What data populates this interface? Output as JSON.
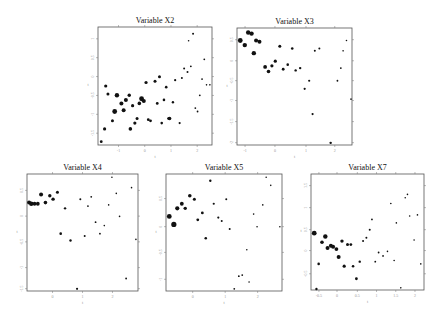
{
  "chart_data": [
    {
      "type": "scatter",
      "title": "Variable X2",
      "xlabel": "t",
      "ylabel": "t",
      "frame": {
        "x": 98,
        "y": 27,
        "w": 114,
        "h": 118
      },
      "xticks": [
        {
          "label": "-1",
          "f": 0.18
        },
        {
          "label": "0",
          "f": 0.41
        },
        {
          "label": "1",
          "f": 0.64
        },
        {
          "label": "2",
          "f": 0.87
        }
      ],
      "yticks": [
        {
          "label": "1",
          "f": 0.1
        },
        {
          "label": "0.5",
          "f": 0.26
        },
        {
          "label": "0",
          "f": 0.42
        },
        {
          "label": "-0.5",
          "f": 0.58
        },
        {
          "label": "-1",
          "f": 0.74
        },
        {
          "label": "-1.5",
          "f": 0.9
        }
      ],
      "points": [
        [
          0.02,
          0.98,
          1.4
        ],
        [
          0.05,
          0.87,
          1.6
        ],
        [
          0.06,
          0.5,
          1.6
        ],
        [
          0.08,
          0.57,
          1.5
        ],
        [
          0.12,
          0.8,
          1.5
        ],
        [
          0.14,
          0.72,
          2.4
        ],
        [
          0.16,
          0.58,
          2.2
        ],
        [
          0.2,
          0.65,
          2.0
        ],
        [
          0.22,
          0.71,
          2.0
        ],
        [
          0.24,
          0.62,
          2.0
        ],
        [
          0.27,
          0.58,
          1.7
        ],
        [
          0.3,
          0.67,
          1.6
        ],
        [
          0.28,
          0.87,
          1.8
        ],
        [
          0.32,
          0.82,
          1.6
        ],
        [
          0.34,
          0.78,
          1.5
        ],
        [
          0.36,
          0.65,
          1.8
        ],
        [
          0.38,
          0.61,
          2.4
        ],
        [
          0.4,
          0.63,
          2.0
        ],
        [
          0.42,
          0.47,
          1.6
        ],
        [
          0.44,
          0.79,
          1.4
        ],
        [
          0.46,
          0.8,
          1.4
        ],
        [
          0.5,
          0.46,
          1.5
        ],
        [
          0.52,
          0.65,
          1.4
        ],
        [
          0.54,
          0.42,
          1.5
        ],
        [
          0.56,
          0.82,
          1.3
        ],
        [
          0.58,
          0.62,
          1.3
        ],
        [
          0.6,
          0.51,
          1.3
        ],
        [
          0.62,
          0.78,
          1.3
        ],
        [
          0.63,
          0.78,
          1.8
        ],
        [
          0.66,
          0.64,
          1.2
        ],
        [
          0.68,
          0.45,
          1.1
        ],
        [
          0.72,
          0.82,
          1.1
        ],
        [
          0.74,
          0.43,
          1.0
        ],
        [
          0.76,
          0.35,
          1.0
        ],
        [
          0.79,
          0.38,
          1.0
        ],
        [
          0.82,
          0.33,
          0.9
        ],
        [
          0.84,
          0.05,
          1.0
        ],
        [
          0.86,
          0.69,
          0.9
        ],
        [
          0.88,
          0.72,
          0.9
        ],
        [
          0.9,
          0.58,
          0.9
        ],
        [
          0.92,
          0.44,
          0.9
        ],
        [
          0.94,
          0.27,
          0.9
        ],
        [
          0.96,
          0.49,
          0.8
        ],
        [
          0.99,
          0.49,
          0.8
        ],
        [
          0.8,
          0.11,
          0.8
        ]
      ]
    },
    {
      "type": "scatter",
      "title": "Variable X3",
      "xlabel": "t",
      "ylabel": "t",
      "frame": {
        "x": 237,
        "y": 28,
        "w": 115,
        "h": 117
      },
      "xticks": [
        {
          "label": "-1",
          "f": 0.07
        },
        {
          "label": "0",
          "f": 0.33
        },
        {
          "label": "1",
          "f": 0.6
        },
        {
          "label": "2",
          "f": 0.85
        }
      ],
      "yticks": [
        {
          "label": "0.5",
          "f": 0.1
        },
        {
          "label": "0",
          "f": 0.28
        },
        {
          "label": "-0.5",
          "f": 0.45
        },
        {
          "label": "-1",
          "f": 0.62
        },
        {
          "label": "-1.5",
          "f": 0.8
        },
        {
          "label": "-2",
          "f": 0.98
        }
      ],
      "points": [
        [
          0.02,
          0.1,
          2.4
        ],
        [
          0.06,
          0.14,
          2.2
        ],
        [
          0.09,
          0.03,
          2.2
        ],
        [
          0.12,
          0.04,
          2.2
        ],
        [
          0.16,
          0.1,
          2.0
        ],
        [
          0.19,
          0.11,
          2.0
        ],
        [
          0.14,
          0.21,
          2.2
        ],
        [
          0.24,
          0.33,
          1.9
        ],
        [
          0.27,
          0.37,
          1.8
        ],
        [
          0.3,
          0.32,
          1.6
        ],
        [
          0.33,
          0.28,
          1.6
        ],
        [
          0.37,
          0.15,
          1.5
        ],
        [
          0.4,
          0.35,
          1.4
        ],
        [
          0.44,
          0.31,
          1.3
        ],
        [
          0.48,
          0.17,
          1.3
        ],
        [
          0.51,
          0.36,
          1.2
        ],
        [
          0.55,
          0.34,
          1.2
        ],
        [
          0.59,
          0.52,
          1.1
        ],
        [
          0.63,
          0.45,
          1.1
        ],
        [
          0.66,
          0.74,
          1.1
        ],
        [
          0.68,
          0.19,
          1.0
        ],
        [
          0.72,
          0.17,
          1.0
        ],
        [
          0.82,
          0.99,
          1.2
        ],
        [
          0.88,
          0.45,
          0.9
        ],
        [
          0.91,
          0.34,
          0.9
        ],
        [
          0.96,
          0.1,
          0.8
        ],
        [
          1.0,
          0.61,
          0.8
        ],
        [
          0.93,
          0.19,
          0.8
        ]
      ]
    },
    {
      "type": "scatter",
      "title": "Variable X4",
      "xlabel": "t",
      "ylabel": "t",
      "frame": {
        "x": 27,
        "y": 174,
        "w": 111,
        "h": 117
      },
      "xticks": [
        {
          "label": "0",
          "f": 0.23
        },
        {
          "label": "1",
          "f": 0.5
        },
        {
          "label": "2",
          "f": 0.77
        }
      ],
      "yticks": [
        {
          "label": "0.5",
          "f": 0.14
        },
        {
          "label": "0",
          "f": 0.36
        },
        {
          "label": "-0.5",
          "f": 0.58
        },
        {
          "label": "-1",
          "f": 0.8
        },
        {
          "label": "-1.5",
          "f": 0.98
        }
      ],
      "points": [
        [
          0.01,
          0.24,
          2.0
        ],
        [
          0.03,
          0.25,
          2.2
        ],
        [
          0.06,
          0.25,
          1.9
        ],
        [
          0.09,
          0.25,
          1.9
        ],
        [
          0.12,
          0.17,
          2.0
        ],
        [
          0.16,
          0.24,
          1.8
        ],
        [
          0.2,
          0.18,
          1.7
        ],
        [
          0.23,
          0.21,
          1.7
        ],
        [
          0.27,
          0.15,
          1.5
        ],
        [
          0.3,
          0.51,
          1.3
        ],
        [
          0.34,
          0.29,
          1.2
        ],
        [
          0.39,
          0.57,
          1.2
        ],
        [
          0.45,
          0.99,
          1.1
        ],
        [
          0.48,
          0.21,
          1.0
        ],
        [
          0.52,
          0.53,
          1.0
        ],
        [
          0.55,
          0.27,
          0.9
        ],
        [
          0.58,
          0.19,
          0.9
        ],
        [
          0.62,
          0.41,
          0.9
        ],
        [
          0.66,
          0.51,
          0.9
        ],
        [
          0.7,
          0.44,
          0.8
        ],
        [
          0.74,
          0.26,
          0.8
        ],
        [
          0.77,
          0.02,
          0.8
        ],
        [
          0.81,
          0.16,
          0.8
        ],
        [
          0.84,
          0.36,
          0.8
        ],
        [
          0.9,
          0.9,
          0.9
        ],
        [
          0.95,
          0.11,
          0.8
        ],
        [
          0.99,
          0.56,
          0.8
        ]
      ]
    },
    {
      "type": "scatter",
      "title": "Variable X5",
      "xlabel": "t",
      "ylabel": "t",
      "frame": {
        "x": 166,
        "y": 174,
        "w": 116,
        "h": 117
      },
      "xticks": [
        {
          "label": "0",
          "f": 0.23
        },
        {
          "label": "1",
          "f": 0.51
        },
        {
          "label": "2",
          "f": 0.79
        }
      ],
      "yticks": [
        {
          "label": "0.5",
          "f": 0.21
        },
        {
          "label": "0",
          "f": 0.45
        },
        {
          "label": "-0.5",
          "f": 0.67
        },
        {
          "label": "-1",
          "f": 0.9
        }
      ],
      "points": [
        [
          0.02,
          0.36,
          2.4
        ],
        [
          0.06,
          0.43,
          2.6
        ],
        [
          0.09,
          0.29,
          2.1
        ],
        [
          0.13,
          0.25,
          1.9
        ],
        [
          0.16,
          0.29,
          1.7
        ],
        [
          0.2,
          0.18,
          1.8
        ],
        [
          0.24,
          0.21,
          1.5
        ],
        [
          0.27,
          0.39,
          1.4
        ],
        [
          0.31,
          0.33,
          1.4
        ],
        [
          0.34,
          0.55,
          1.3
        ],
        [
          0.38,
          0.05,
          1.2
        ],
        [
          0.41,
          0.25,
          1.1
        ],
        [
          0.45,
          0.37,
          1.1
        ],
        [
          0.48,
          0.4,
          1.0
        ],
        [
          0.52,
          0.21,
          1.0
        ],
        [
          0.55,
          0.47,
          1.0
        ],
        [
          0.59,
          0.99,
          0.9
        ],
        [
          0.63,
          0.88,
          0.9
        ],
        [
          0.66,
          0.87,
          0.9
        ],
        [
          0.7,
          0.65,
          0.8
        ],
        [
          0.72,
          0.93,
          0.8
        ],
        [
          0.76,
          0.34,
          0.8
        ],
        [
          0.79,
          0.45,
          0.8
        ],
        [
          0.84,
          0.26,
          0.8
        ],
        [
          0.87,
          0.02,
          0.8
        ],
        [
          0.91,
          0.09,
          0.8
        ],
        [
          0.99,
          0.45,
          0.8
        ]
      ]
    },
    {
      "type": "scatter",
      "title": "Variable X7",
      "xlabel": "t",
      "ylabel": "t",
      "frame": {
        "x": 311,
        "y": 174,
        "w": 113,
        "h": 116
      },
      "xticks": [
        {
          "label": "-0.5",
          "f": 0.07
        },
        {
          "label": "0",
          "f": 0.23
        },
        {
          "label": "0.5",
          "f": 0.41
        },
        {
          "label": "1",
          "f": 0.58
        },
        {
          "label": "1.5",
          "f": 0.75
        },
        {
          "label": "2",
          "f": 0.92
        }
      ],
      "yticks": [
        {
          "label": "1.5",
          "f": 0.1
        },
        {
          "label": "1",
          "f": 0.29
        },
        {
          "label": "0.5",
          "f": 0.48
        },
        {
          "label": "0",
          "f": 0.66
        },
        {
          "label": "-0.5",
          "f": 0.86
        }
      ],
      "points": [
        [
          0.02,
          0.51,
          2.4
        ],
        [
          0.06,
          0.78,
          1.3
        ],
        [
          0.09,
          0.59,
          1.8
        ],
        [
          0.12,
          0.54,
          2.2
        ],
        [
          0.14,
          0.64,
          2.0
        ],
        [
          0.17,
          0.62,
          2.0
        ],
        [
          0.19,
          0.63,
          2.0
        ],
        [
          0.22,
          0.65,
          1.9
        ],
        [
          0.24,
          0.72,
          2.0
        ],
        [
          0.27,
          0.58,
          1.7
        ],
        [
          0.29,
          0.8,
          1.6
        ],
        [
          0.32,
          0.61,
          1.5
        ],
        [
          0.35,
          0.61,
          1.4
        ],
        [
          0.37,
          0.8,
          1.3
        ],
        [
          0.4,
          0.91,
          1.4
        ],
        [
          0.43,
          0.76,
          1.2
        ],
        [
          0.46,
          0.58,
          1.0
        ],
        [
          0.49,
          0.55,
          1.0
        ],
        [
          0.52,
          0.48,
          1.0
        ],
        [
          0.54,
          0.39,
          0.9
        ],
        [
          0.57,
          0.76,
          0.9
        ],
        [
          0.6,
          0.68,
          0.9
        ],
        [
          0.64,
          0.71,
          0.9
        ],
        [
          0.68,
          0.67,
          0.8
        ],
        [
          0.71,
          0.25,
          0.8
        ],
        [
          0.74,
          0.75,
          0.8
        ],
        [
          0.76,
          0.42,
          0.8
        ],
        [
          0.8,
          0.99,
          0.8
        ],
        [
          0.84,
          0.2,
          0.8
        ],
        [
          0.86,
          0.17,
          0.8
        ],
        [
          0.88,
          0.36,
          0.8
        ],
        [
          0.92,
          0.57,
          0.8
        ],
        [
          0.95,
          0.35,
          0.8
        ],
        [
          0.98,
          0.78,
          0.8
        ],
        [
          0.04,
          1.0,
          1.2
        ]
      ]
    }
  ]
}
